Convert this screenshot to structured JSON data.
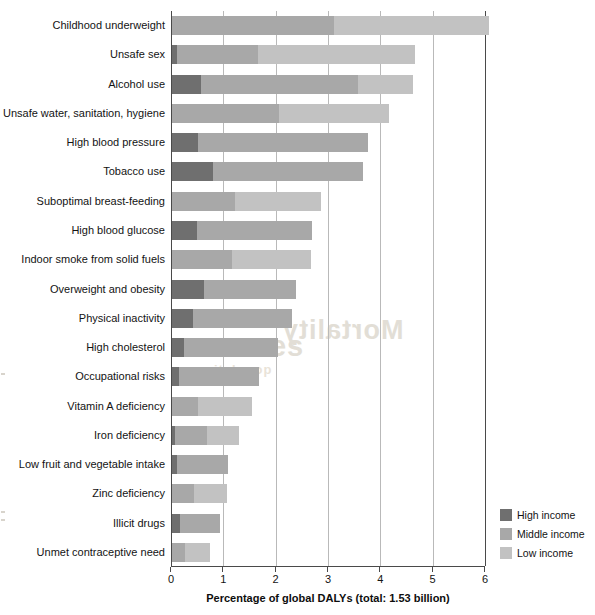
{
  "chart_data": {
    "type": "bar",
    "orientation": "horizontal",
    "stacked": true,
    "title": "",
    "xlabel": "Percentage of global DALYs (total: 1.53 billion)",
    "ylabel": "",
    "xlim": [
      0,
      6
    ],
    "xticks": [
      0,
      1,
      2,
      3,
      4,
      5,
      6
    ],
    "xtick_labels": [
      "0",
      "1",
      "2",
      "3",
      "4",
      "5",
      "6"
    ],
    "grid": true,
    "grid_axis": "x",
    "legend_position": "bottom-right",
    "categories": [
      "Childhood underweight",
      "Unsafe sex",
      "Alcohol use",
      "Unsafe water, sanitation, hygiene",
      "High blood pressure",
      "Tobacco use",
      "Suboptimal breast-feeding",
      "High blood glucose",
      "Indoor smoke from solid fuels",
      "Overweight and obesity",
      "Physical inactivity",
      "High cholesterol",
      "Occupational risks",
      "Vitamin A deficiency",
      "Iron deficiency",
      "Low fruit and vegetable intake",
      "Zinc deficiency",
      "Illicit drugs",
      "Unmet contraceptive need"
    ],
    "series": [
      {
        "name": "High income",
        "color": "#6f6f6f",
        "values": [
          0.0,
          0.1,
          0.55,
          0.0,
          0.5,
          0.78,
          0.0,
          0.48,
          0.0,
          0.62,
          0.4,
          0.22,
          0.13,
          0.0,
          0.06,
          0.1,
          0.0,
          0.16,
          0.0
        ]
      },
      {
        "name": "Middle income",
        "color": "#a8a8a8",
        "values": [
          3.1,
          1.55,
          3.0,
          2.05,
          3.25,
          2.87,
          1.2,
          2.2,
          1.15,
          1.75,
          1.89,
          1.81,
          1.53,
          0.5,
          0.6,
          0.97,
          0.42,
          0.76,
          0.25
        ]
      },
      {
        "name": "Low income",
        "color": "#c2c2c2",
        "values": [
          2.95,
          3.0,
          1.06,
          2.1,
          0.0,
          0.0,
          1.65,
          0.0,
          1.51,
          0.0,
          0.0,
          0.0,
          0.0,
          1.03,
          0.62,
          0.0,
          0.63,
          0.0,
          0.48
        ]
      }
    ],
    "totals": [
      6.05,
      4.65,
      4.61,
      4.15,
      3.75,
      3.65,
      2.85,
      2.68,
      2.66,
      2.37,
      2.29,
      2.03,
      1.66,
      1.53,
      1.28,
      1.07,
      1.05,
      0.92,
      0.73
    ],
    "units": "percentage of global DALYs"
  },
  "legend": {
    "items": [
      {
        "label": "High income",
        "color": "#6f6f6f"
      },
      {
        "label": "Middle income",
        "color": "#a8a8a8"
      },
      {
        "label": "Low income",
        "color": "#c2c2c2"
      }
    ]
  },
  "ghost_text": {
    "line_a": "sources",
    "line_b": "noitalupop",
    "line_c": "Mortality"
  }
}
